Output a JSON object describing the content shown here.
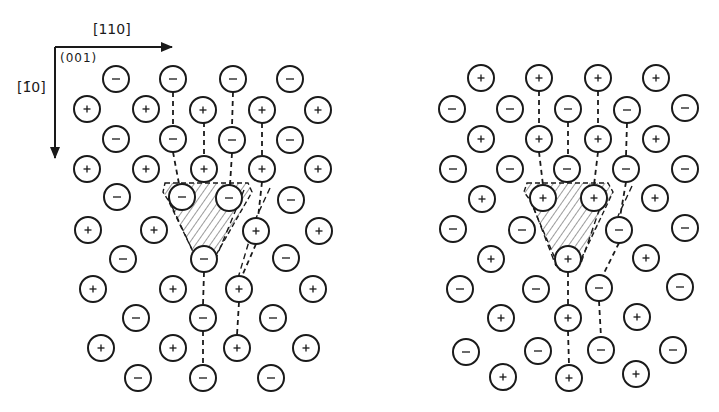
{
  "figure": {
    "axes": {
      "x_direction_label": "[110]",
      "y_direction_label": "[1̄0]",
      "y_direction_label_plain": "[1-10]",
      "plane_label": "(001)",
      "origin": [
        55,
        47
      ],
      "x_arrow_end": [
        172,
        47
      ],
      "y_arrow_end": [
        55,
        158
      ]
    },
    "style": {
      "ink": "#1a1a1a",
      "hatch": "#3a3a3a",
      "background": "#ffffff",
      "ion_radius": 13
    },
    "panels": [
      {
        "name": "left-panel",
        "description": "Surface layer with anion termination near the defect",
        "ions": [
          {
            "x": 116,
            "y": 79,
            "s": "-"
          },
          {
            "x": 173,
            "y": 79,
            "s": "-"
          },
          {
            "x": 233,
            "y": 79,
            "s": "-"
          },
          {
            "x": 290,
            "y": 79,
            "s": "-"
          },
          {
            "x": 87,
            "y": 109,
            "s": "+"
          },
          {
            "x": 146,
            "y": 109,
            "s": "+"
          },
          {
            "x": 203,
            "y": 110,
            "s": "+"
          },
          {
            "x": 262,
            "y": 110,
            "s": "+"
          },
          {
            "x": 318,
            "y": 110,
            "s": "+"
          },
          {
            "x": 116,
            "y": 139,
            "s": "-"
          },
          {
            "x": 173,
            "y": 139,
            "s": "-"
          },
          {
            "x": 232,
            "y": 140,
            "s": "-"
          },
          {
            "x": 290,
            "y": 140,
            "s": "-"
          },
          {
            "x": 87,
            "y": 169,
            "s": "+"
          },
          {
            "x": 146,
            "y": 169,
            "s": "+"
          },
          {
            "x": 204,
            "y": 169,
            "s": "+"
          },
          {
            "x": 262,
            "y": 169,
            "s": "+"
          },
          {
            "x": 318,
            "y": 169,
            "s": "+"
          },
          {
            "x": 117,
            "y": 197,
            "s": "-"
          },
          {
            "x": 182,
            "y": 197,
            "s": "-"
          },
          {
            "x": 229,
            "y": 198,
            "s": "-"
          },
          {
            "x": 291,
            "y": 200,
            "s": "-"
          },
          {
            "x": 88,
            "y": 230,
            "s": "+"
          },
          {
            "x": 154,
            "y": 230,
            "s": "+"
          },
          {
            "x": 256,
            "y": 231,
            "s": "+"
          },
          {
            "x": 319,
            "y": 231,
            "s": "+"
          },
          {
            "x": 123,
            "y": 259,
            "s": "-"
          },
          {
            "x": 204,
            "y": 259,
            "s": "-"
          },
          {
            "x": 286,
            "y": 258,
            "s": "-"
          },
          {
            "x": 93,
            "y": 289,
            "s": "+"
          },
          {
            "x": 173,
            "y": 289,
            "s": "+"
          },
          {
            "x": 239,
            "y": 289,
            "s": "+"
          },
          {
            "x": 313,
            "y": 289,
            "s": "+"
          },
          {
            "x": 136,
            "y": 318,
            "s": "-"
          },
          {
            "x": 203,
            "y": 318,
            "s": "-"
          },
          {
            "x": 273,
            "y": 318,
            "s": "-"
          },
          {
            "x": 101,
            "y": 348,
            "s": "+"
          },
          {
            "x": 173,
            "y": 348,
            "s": "+"
          },
          {
            "x": 237,
            "y": 348,
            "s": "+"
          },
          {
            "x": 306,
            "y": 348,
            "s": "+"
          },
          {
            "x": 138,
            "y": 378,
            "s": "-"
          },
          {
            "x": 203,
            "y": 378,
            "s": "-"
          },
          {
            "x": 271,
            "y": 378,
            "s": "-"
          }
        ],
        "dashed_bonds": [
          [
            [
              173,
              92
            ],
            [
              173,
              126
            ]
          ],
          [
            [
              233,
              92
            ],
            [
              232,
              127
            ]
          ],
          [
            [
              173,
              152
            ],
            [
              179,
              184
            ]
          ],
          [
            [
              232,
              153
            ],
            [
              230,
              185
            ]
          ],
          [
            [
              262,
              182
            ],
            [
              258,
              218
            ]
          ],
          [
            [
              204,
              122
            ],
            [
              204,
              156
            ]
          ],
          [
            [
              262,
              123
            ],
            [
              262,
              156
            ]
          ],
          [
            [
              256,
              244
            ],
            [
              242,
              276
            ]
          ],
          [
            [
              204,
              272
            ],
            [
              203,
              305
            ]
          ],
          [
            [
              239,
              302
            ],
            [
              237,
              335
            ]
          ],
          [
            [
              203,
              331
            ],
            [
              203,
              365
            ]
          ]
        ],
        "defect_region": {
          "polygon": [
            [
              165,
              183
            ],
            [
              248,
              183
            ],
            [
              252,
              192
            ],
            [
              212,
              262
            ],
            [
              198,
              262
            ],
            [
              168,
              200
            ],
            [
              163,
              192
            ]
          ],
          "outline_dashed": true
        },
        "extra_dashed_outline": [
          [
            [
              244,
              190
            ],
            [
              216,
              258
            ]
          ],
          [
            [
              168,
              198
            ],
            [
              196,
              258
            ]
          ],
          [
            [
              270,
              188
            ],
            [
              256,
              218
            ],
            [
              238,
              278
            ]
          ]
        ]
      },
      {
        "name": "right-panel",
        "description": "Surface layer with cation termination near the defect",
        "ions": [
          {
            "x": 481,
            "y": 78,
            "s": "+"
          },
          {
            "x": 539,
            "y": 78,
            "s": "+"
          },
          {
            "x": 598,
            "y": 78,
            "s": "+"
          },
          {
            "x": 656,
            "y": 78,
            "s": "+"
          },
          {
            "x": 452,
            "y": 109,
            "s": "-"
          },
          {
            "x": 510,
            "y": 109,
            "s": "-"
          },
          {
            "x": 568,
            "y": 109,
            "s": "-"
          },
          {
            "x": 627,
            "y": 110,
            "s": "-"
          },
          {
            "x": 685,
            "y": 108,
            "s": "-"
          },
          {
            "x": 481,
            "y": 139,
            "s": "+"
          },
          {
            "x": 539,
            "y": 139,
            "s": "+"
          },
          {
            "x": 598,
            "y": 139,
            "s": "+"
          },
          {
            "x": 656,
            "y": 139,
            "s": "+"
          },
          {
            "x": 453,
            "y": 169,
            "s": "-"
          },
          {
            "x": 510,
            "y": 169,
            "s": "-"
          },
          {
            "x": 567,
            "y": 169,
            "s": "-"
          },
          {
            "x": 626,
            "y": 169,
            "s": "-"
          },
          {
            "x": 685,
            "y": 169,
            "s": "-"
          },
          {
            "x": 482,
            "y": 199,
            "s": "+"
          },
          {
            "x": 543,
            "y": 198,
            "s": "+"
          },
          {
            "x": 594,
            "y": 198,
            "s": "+"
          },
          {
            "x": 655,
            "y": 198,
            "s": "+"
          },
          {
            "x": 453,
            "y": 229,
            "s": "-"
          },
          {
            "x": 522,
            "y": 230,
            "s": "-"
          },
          {
            "x": 619,
            "y": 230,
            "s": "-"
          },
          {
            "x": 685,
            "y": 228,
            "s": "-"
          },
          {
            "x": 491,
            "y": 259,
            "s": "+"
          },
          {
            "x": 568,
            "y": 259,
            "s": "+"
          },
          {
            "x": 646,
            "y": 258,
            "s": "+"
          },
          {
            "x": 460,
            "y": 289,
            "s": "-"
          },
          {
            "x": 536,
            "y": 289,
            "s": "-"
          },
          {
            "x": 599,
            "y": 288,
            "s": "-"
          },
          {
            "x": 680,
            "y": 287,
            "s": "-"
          },
          {
            "x": 501,
            "y": 318,
            "s": "+"
          },
          {
            "x": 568,
            "y": 318,
            "s": "+"
          },
          {
            "x": 637,
            "y": 317,
            "s": "+"
          },
          {
            "x": 466,
            "y": 352,
            "s": "-"
          },
          {
            "x": 538,
            "y": 351,
            "s": "-"
          },
          {
            "x": 601,
            "y": 350,
            "s": "-"
          },
          {
            "x": 673,
            "y": 350,
            "s": "-"
          },
          {
            "x": 503,
            "y": 377,
            "s": "+"
          },
          {
            "x": 569,
            "y": 378,
            "s": "+"
          },
          {
            "x": 636,
            "y": 374,
            "s": "+"
          }
        ],
        "dashed_bonds": [
          [
            [
              539,
              91
            ],
            [
              539,
              126
            ]
          ],
          [
            [
              598,
              91
            ],
            [
              598,
              126
            ]
          ],
          [
            [
              539,
              152
            ],
            [
              543,
              185
            ]
          ],
          [
            [
              598,
              152
            ],
            [
              594,
              185
            ]
          ],
          [
            [
              568,
              122
            ],
            [
              568,
              156
            ]
          ],
          [
            [
              627,
              123
            ],
            [
              626,
              156
            ]
          ],
          [
            [
              626,
              182
            ],
            [
              620,
              217
            ]
          ],
          [
            [
              619,
              243
            ],
            [
              603,
              275
            ]
          ],
          [
            [
              568,
              272
            ],
            [
              568,
              305
            ]
          ],
          [
            [
              599,
              301
            ],
            [
              601,
              337
            ]
          ],
          [
            [
              568,
              331
            ],
            [
              569,
              365
            ]
          ]
        ],
        "defect_region": {
          "polygon": [
            [
              527,
              183
            ],
            [
              608,
              183
            ],
            [
              613,
              192
            ],
            [
              576,
              270
            ],
            [
              560,
              270
            ],
            [
              530,
              200
            ],
            [
              524,
              192
            ]
          ],
          "outline_dashed": true
        },
        "extra_dashed_outline": [
          [
            [
              606,
              190
            ],
            [
              580,
              266
            ]
          ],
          [
            [
              530,
              198
            ],
            [
              556,
              266
            ]
          ],
          [
            [
              632,
              186
            ],
            [
              618,
              216
            ]
          ]
        ]
      }
    ]
  }
}
